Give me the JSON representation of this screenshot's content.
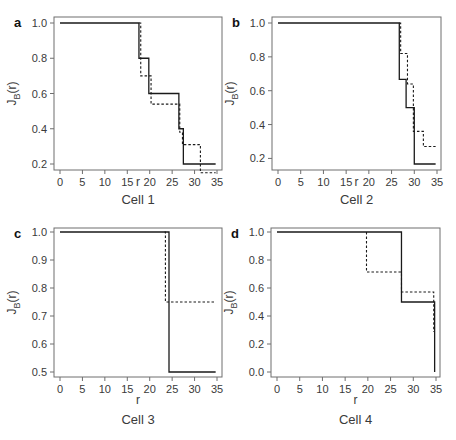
{
  "chart_data": [
    {
      "type": "line",
      "panel": "a",
      "caption": "Cell 1",
      "xlabel": "r",
      "ylabel": "J_B(r)",
      "xlim": [
        0,
        35
      ],
      "ylim": [
        0.2,
        1.0
      ],
      "xticks": [
        0,
        5,
        10,
        15,
        20,
        25,
        30,
        35
      ],
      "yticks": [
        0.2,
        0.4,
        0.6,
        0.8,
        1.0
      ],
      "ytick_labels": [
        "0.2",
        "0.4",
        "0.6",
        "0.8",
        "1.0"
      ],
      "series": [
        {
          "name": "solid",
          "style": "solid",
          "steps": [
            [
              0,
              1.0
            ],
            [
              17.6,
              0.8
            ],
            [
              19.8,
              0.6
            ],
            [
              26.5,
              0.4
            ],
            [
              27.5,
              0.2
            ]
          ],
          "end": 34.7
        },
        {
          "name": "dashed",
          "style": "dashed",
          "steps": [
            [
              17.6,
              1.0
            ],
            [
              18.0,
              0.7
            ],
            [
              20.3,
              0.54
            ],
            [
              26.7,
              0.38
            ],
            [
              27.3,
              0.31
            ],
            [
              31.3,
              0.15
            ]
          ],
          "end": 34.7
        }
      ]
    },
    {
      "type": "line",
      "panel": "b",
      "caption": "Cell 2",
      "xlabel": "r",
      "ylabel": "J_B(r)",
      "xlim": [
        0,
        35
      ],
      "ylim": [
        0.167,
        1.0
      ],
      "xticks": [
        0,
        5,
        10,
        15,
        20,
        25,
        30,
        35
      ],
      "yticks": [
        0.2,
        0.4,
        0.6,
        0.8,
        1.0
      ],
      "ytick_labels": [
        "0.2",
        "0.4",
        "0.6",
        "0.8",
        "1.0"
      ],
      "series": [
        {
          "name": "solid",
          "style": "solid",
          "steps": [
            [
              0,
              1.0
            ],
            [
              26.7,
              0.667
            ],
            [
              28.2,
              0.5
            ],
            [
              30.0,
              0.167
            ]
          ],
          "end": 34.7
        },
        {
          "name": "dashed",
          "style": "dashed",
          "steps": [
            [
              26.7,
              1.0
            ],
            [
              27.0,
              0.82
            ],
            [
              28.5,
              0.64
            ],
            [
              29.8,
              0.36
            ],
            [
              32.0,
              0.27
            ]
          ],
          "end": 34.7
        }
      ]
    },
    {
      "type": "line",
      "panel": "c",
      "caption": "Cell 3",
      "xlabel": "r",
      "ylabel": "J_B(r)",
      "xlim": [
        0,
        35
      ],
      "ylim": [
        0.5,
        1.0
      ],
      "xticks": [
        0,
        5,
        10,
        15,
        20,
        25,
        30,
        35
      ],
      "yticks": [
        0.5,
        0.6,
        0.7,
        0.8,
        0.9,
        1.0
      ],
      "ytick_labels": [
        "0.5",
        "0.6",
        "0.7",
        "0.8",
        "0.9",
        "1.0"
      ],
      "series": [
        {
          "name": "solid",
          "style": "solid",
          "steps": [
            [
              0,
              1.0
            ],
            [
              24.3,
              0.5
            ]
          ],
          "end": 34.7
        },
        {
          "name": "dashed",
          "style": "dashed",
          "steps": [
            [
              23.3,
              1.0
            ],
            [
              23.5,
              0.75
            ]
          ],
          "end": 34.7
        }
      ]
    },
    {
      "type": "line",
      "panel": "d",
      "caption": "Cell 4",
      "xlabel": "r",
      "ylabel": "J_B(r)",
      "xlim": [
        0,
        35
      ],
      "ylim": [
        0.0,
        1.0
      ],
      "xticks": [
        0,
        5,
        10,
        15,
        20,
        25,
        30,
        35
      ],
      "yticks": [
        0.0,
        0.2,
        0.4,
        0.6,
        0.8,
        1.0
      ],
      "ytick_labels": [
        "0.0",
        "0.2",
        "0.4",
        "0.6",
        "0.8",
        "1.0"
      ],
      "series": [
        {
          "name": "solid",
          "style": "solid",
          "steps": [
            [
              0,
              1.0
            ],
            [
              27.4,
              0.5
            ],
            [
              34.7,
              0.0
            ]
          ],
          "end": 34.7
        },
        {
          "name": "dashed",
          "style": "dashed",
          "steps": [
            [
              19.7,
              1.0
            ],
            [
              19.7,
              0.714
            ],
            [
              27.4,
              0.571
            ],
            [
              34.5,
              0.286
            ]
          ],
          "end": 34.5
        }
      ]
    }
  ]
}
